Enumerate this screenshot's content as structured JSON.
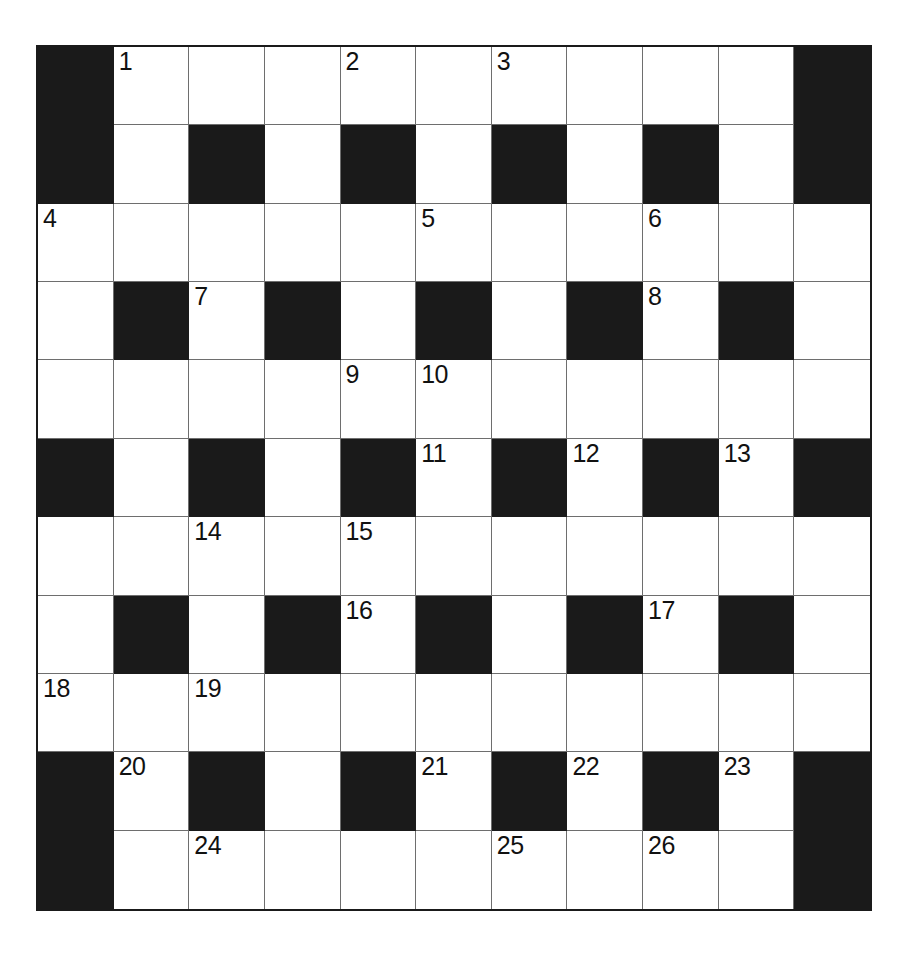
{
  "puzzle": {
    "kind": "crossword-grid",
    "rows": 11,
    "cols": 11,
    "colors": {
      "block": "#1a1a1a",
      "open": "#ffffff",
      "gridline": "#6e6e6e",
      "number": "#111111",
      "page_background": "#ffffff"
    },
    "grid": [
      [
        {
          "type": "block",
          "number": ""
        },
        {
          "type": "open",
          "number": "1"
        },
        {
          "type": "open",
          "number": ""
        },
        {
          "type": "open",
          "number": ""
        },
        {
          "type": "open",
          "number": "2"
        },
        {
          "type": "open",
          "number": ""
        },
        {
          "type": "open",
          "number": "3"
        },
        {
          "type": "open",
          "number": ""
        },
        {
          "type": "open",
          "number": ""
        },
        {
          "type": "open",
          "number": ""
        },
        {
          "type": "block",
          "number": ""
        }
      ],
      [
        {
          "type": "block",
          "number": ""
        },
        {
          "type": "open",
          "number": ""
        },
        {
          "type": "block",
          "number": ""
        },
        {
          "type": "open",
          "number": ""
        },
        {
          "type": "block",
          "number": ""
        },
        {
          "type": "open",
          "number": ""
        },
        {
          "type": "block",
          "number": ""
        },
        {
          "type": "open",
          "number": ""
        },
        {
          "type": "block",
          "number": ""
        },
        {
          "type": "open",
          "number": ""
        },
        {
          "type": "block",
          "number": ""
        }
      ],
      [
        {
          "type": "open",
          "number": "4"
        },
        {
          "type": "open",
          "number": ""
        },
        {
          "type": "open",
          "number": ""
        },
        {
          "type": "open",
          "number": ""
        },
        {
          "type": "open",
          "number": ""
        },
        {
          "type": "open",
          "number": "5"
        },
        {
          "type": "open",
          "number": ""
        },
        {
          "type": "open",
          "number": ""
        },
        {
          "type": "open",
          "number": "6"
        },
        {
          "type": "open",
          "number": ""
        },
        {
          "type": "open",
          "number": ""
        }
      ],
      [
        {
          "type": "open",
          "number": ""
        },
        {
          "type": "block",
          "number": ""
        },
        {
          "type": "open",
          "number": "7"
        },
        {
          "type": "block",
          "number": ""
        },
        {
          "type": "open",
          "number": ""
        },
        {
          "type": "block",
          "number": ""
        },
        {
          "type": "open",
          "number": ""
        },
        {
          "type": "block",
          "number": ""
        },
        {
          "type": "open",
          "number": "8"
        },
        {
          "type": "block",
          "number": ""
        },
        {
          "type": "open",
          "number": ""
        }
      ],
      [
        {
          "type": "open",
          "number": ""
        },
        {
          "type": "open",
          "number": ""
        },
        {
          "type": "open",
          "number": ""
        },
        {
          "type": "open",
          "number": ""
        },
        {
          "type": "open",
          "number": "9"
        },
        {
          "type": "open",
          "number": "10"
        },
        {
          "type": "open",
          "number": ""
        },
        {
          "type": "open",
          "number": ""
        },
        {
          "type": "open",
          "number": ""
        },
        {
          "type": "open",
          "number": ""
        },
        {
          "type": "open",
          "number": ""
        }
      ],
      [
        {
          "type": "block",
          "number": ""
        },
        {
          "type": "open",
          "number": ""
        },
        {
          "type": "block",
          "number": ""
        },
        {
          "type": "open",
          "number": ""
        },
        {
          "type": "block",
          "number": ""
        },
        {
          "type": "open",
          "number": "11"
        },
        {
          "type": "block",
          "number": ""
        },
        {
          "type": "open",
          "number": "12"
        },
        {
          "type": "block",
          "number": ""
        },
        {
          "type": "open",
          "number": "13"
        },
        {
          "type": "block",
          "number": ""
        }
      ],
      [
        {
          "type": "open",
          "number": ""
        },
        {
          "type": "open",
          "number": ""
        },
        {
          "type": "open",
          "number": "14"
        },
        {
          "type": "open",
          "number": ""
        },
        {
          "type": "open",
          "number": "15"
        },
        {
          "type": "open",
          "number": ""
        },
        {
          "type": "open",
          "number": ""
        },
        {
          "type": "open",
          "number": ""
        },
        {
          "type": "open",
          "number": ""
        },
        {
          "type": "open",
          "number": ""
        },
        {
          "type": "open",
          "number": ""
        }
      ],
      [
        {
          "type": "open",
          "number": ""
        },
        {
          "type": "block",
          "number": ""
        },
        {
          "type": "open",
          "number": ""
        },
        {
          "type": "block",
          "number": ""
        },
        {
          "type": "open",
          "number": "16"
        },
        {
          "type": "block",
          "number": ""
        },
        {
          "type": "open",
          "number": ""
        },
        {
          "type": "block",
          "number": ""
        },
        {
          "type": "open",
          "number": "17"
        },
        {
          "type": "block",
          "number": ""
        },
        {
          "type": "open",
          "number": ""
        }
      ],
      [
        {
          "type": "open",
          "number": "18"
        },
        {
          "type": "open",
          "number": ""
        },
        {
          "type": "open",
          "number": "19"
        },
        {
          "type": "open",
          "number": ""
        },
        {
          "type": "open",
          "number": ""
        },
        {
          "type": "open",
          "number": ""
        },
        {
          "type": "open",
          "number": ""
        },
        {
          "type": "open",
          "number": ""
        },
        {
          "type": "open",
          "number": ""
        },
        {
          "type": "open",
          "number": ""
        },
        {
          "type": "open",
          "number": ""
        }
      ],
      [
        {
          "type": "block",
          "number": ""
        },
        {
          "type": "open",
          "number": "20"
        },
        {
          "type": "block",
          "number": ""
        },
        {
          "type": "open",
          "number": ""
        },
        {
          "type": "block",
          "number": ""
        },
        {
          "type": "open",
          "number": "21"
        },
        {
          "type": "block",
          "number": ""
        },
        {
          "type": "open",
          "number": "22"
        },
        {
          "type": "block",
          "number": ""
        },
        {
          "type": "open",
          "number": "23"
        },
        {
          "type": "block",
          "number": ""
        }
      ],
      [
        {
          "type": "block",
          "number": ""
        },
        {
          "type": "open",
          "number": ""
        },
        {
          "type": "open",
          "number": "24"
        },
        {
          "type": "open",
          "number": ""
        },
        {
          "type": "open",
          "number": ""
        },
        {
          "type": "open",
          "number": ""
        },
        {
          "type": "open",
          "number": "25"
        },
        {
          "type": "open",
          "number": ""
        },
        {
          "type": "open",
          "number": "26"
        },
        {
          "type": "open",
          "number": ""
        },
        {
          "type": "block",
          "number": ""
        }
      ]
    ],
    "clue_numbers": [
      "1",
      "2",
      "3",
      "4",
      "5",
      "6",
      "7",
      "8",
      "9",
      "10",
      "11",
      "12",
      "13",
      "14",
      "15",
      "16",
      "17",
      "18",
      "19",
      "20",
      "21",
      "22",
      "23",
      "24",
      "25",
      "26"
    ]
  }
}
